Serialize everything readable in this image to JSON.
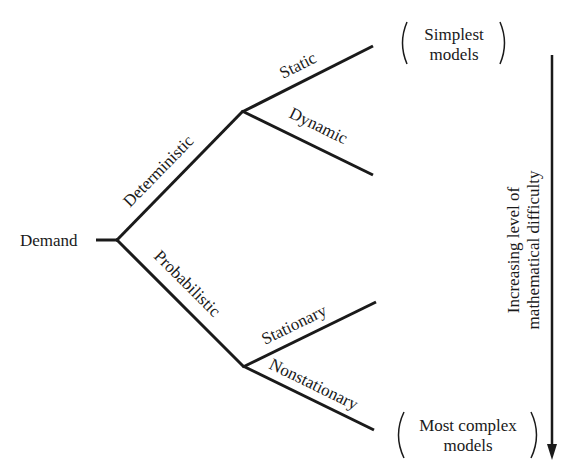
{
  "diagram": {
    "root": {
      "label": "Demand"
    },
    "branches": [
      {
        "label": "Deterministic",
        "children": [
          {
            "label": "Static"
          },
          {
            "label": "Dynamic"
          }
        ]
      },
      {
        "label": "Probabilistic",
        "children": [
          {
            "label": "Stationary"
          },
          {
            "label": "Nonstationary"
          }
        ]
      }
    ],
    "top_note": {
      "line1": "Simplest",
      "line2": "models"
    },
    "bottom_note": {
      "line1": "Most complex",
      "line2": "models"
    },
    "axis": {
      "line1": "Increasing level of",
      "line2": "mathematical difficulty"
    },
    "colors": {
      "ink": "#1a1a1a",
      "background": "#ffffff"
    }
  }
}
